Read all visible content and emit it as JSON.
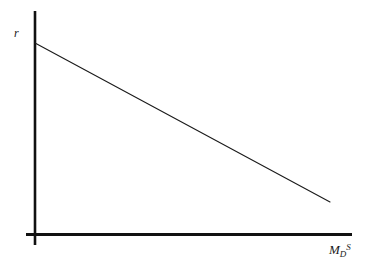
{
  "chart_data": {
    "type": "line",
    "title": "",
    "subtitle": "",
    "xlabel_base": "M",
    "xlabel_sub": "D",
    "xlabel_sup": "S",
    "ylabel": "r",
    "grid": false,
    "legend": null,
    "annotations": [],
    "axes": {
      "x": {
        "label": "M_D^S",
        "ticks": [],
        "ticklabels": [],
        "range_pixels": [
          26,
          352
        ],
        "arrow": false
      },
      "y": {
        "label": "r",
        "ticks": [],
        "ticklabels": [],
        "range_pixels": [
          245,
          11
        ],
        "arrow": false
      }
    },
    "series": [
      {
        "name": "money demand curve",
        "color": "#1a1a1a",
        "linewidth": 1,
        "points": [
          {
            "x": 35,
            "y": 43
          },
          {
            "x": 330,
            "y": 202
          }
        ],
        "description": "downward-sloping straight line"
      }
    ],
    "colors": {
      "background": "#ffffff",
      "axis": "#111111",
      "curve": "#1a1a1a",
      "label": "#1a1a1a"
    }
  }
}
